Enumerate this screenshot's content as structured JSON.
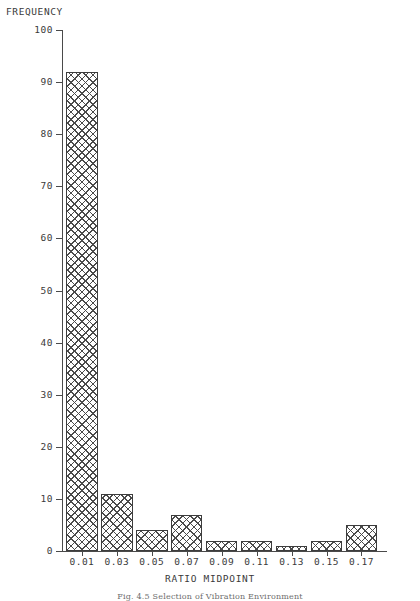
{
  "figure": {
    "y_axis_title": "FREQUENCY",
    "x_axis_title": "RATIO MIDPOINT",
    "caption": "Fig. 4.5  Selection of Vibration Environment"
  },
  "chart_data": {
    "type": "bar",
    "title": "",
    "xlabel": "RATIO MIDPOINT",
    "ylabel": "FREQUENCY",
    "categories": [
      "0.01",
      "0.03",
      "0.05",
      "0.07",
      "0.09",
      "0.11",
      "0.13",
      "0.15",
      "0.17"
    ],
    "values": [
      92,
      11,
      4,
      7,
      2,
      2,
      1,
      2,
      5
    ],
    "ylim": [
      0,
      100
    ],
    "ytick_labels": [
      "0",
      "10",
      "20",
      "30",
      "40",
      "50",
      "60",
      "70",
      "80",
      "90",
      "100"
    ],
    "ytick_values": [
      0,
      10,
      20,
      30,
      40,
      50,
      60,
      70,
      80,
      90,
      100
    ],
    "grid": false,
    "legend": false,
    "bar_fill": "crosshatch",
    "line_color": "#4a4a4a"
  }
}
